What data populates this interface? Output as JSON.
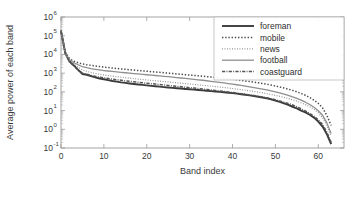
{
  "chart_data": {
    "type": "line",
    "title": "",
    "xlabel": "Band index",
    "ylabel": "Average power of each band",
    "xlim": [
      0,
      66
    ],
    "ylim": [
      0.1,
      1000000
    ],
    "yscale": "log",
    "xticks": [
      0,
      10,
      20,
      30,
      40,
      50,
      60
    ],
    "xticklabels": [
      "0",
      "10",
      "20",
      "30",
      "40",
      "50",
      "60"
    ],
    "yticks": [
      0.1,
      1,
      10,
      100,
      1000,
      10000,
      100000,
      1000000
    ],
    "yticklabels": [
      "10-1",
      "100",
      "101",
      "102",
      "103",
      "104",
      "105",
      "106"
    ],
    "ytick_bases": [
      "10",
      "10",
      "10",
      "10",
      "10",
      "10",
      "10",
      "10"
    ],
    "ytick_exponents": [
      "-1",
      "0",
      "1",
      "2",
      "3",
      "4",
      "5",
      "6"
    ],
    "grid": false,
    "legend_position": "top-right",
    "series": [
      {
        "name": "foreman",
        "style": "solid",
        "color": "#3b3b3b",
        "width": 1.9,
        "dash": "",
        "x": [
          0,
          1,
          2,
          3,
          4,
          5,
          6,
          7,
          8,
          9,
          10,
          11,
          12,
          13,
          14,
          15,
          16,
          17,
          18,
          19,
          20,
          21,
          22,
          23,
          24,
          25,
          26,
          27,
          28,
          29,
          30,
          31,
          32,
          33,
          34,
          35,
          36,
          37,
          38,
          39,
          40,
          41,
          42,
          43,
          44,
          45,
          46,
          47,
          48,
          49,
          50,
          51,
          52,
          53,
          54,
          55,
          56,
          57,
          58,
          59,
          60,
          61,
          62,
          63
        ],
        "y": [
          180000,
          12000,
          4200,
          2600,
          1500,
          900,
          820,
          700,
          600,
          520,
          470,
          420,
          380,
          350,
          320,
          300,
          280,
          262,
          248,
          235,
          222,
          210,
          200,
          190,
          180,
          172,
          164,
          156,
          150,
          143,
          137,
          131,
          126,
          120,
          115,
          110,
          105,
          100,
          95,
          90,
          85,
          80,
          75,
          70,
          65,
          60,
          55,
          50,
          45,
          40,
          34,
          29,
          24,
          20,
          16,
          13,
          10,
          8,
          6,
          4.2,
          2.6,
          1.4,
          0.55,
          0.16
        ]
      },
      {
        "name": "mobile",
        "style": "dotted",
        "color": "#4a4a4a",
        "width": 1.5,
        "dash": "1.4 1.8",
        "x": [
          0,
          1,
          2,
          3,
          4,
          5,
          6,
          7,
          8,
          9,
          10,
          11,
          12,
          13,
          14,
          15,
          16,
          17,
          18,
          19,
          20,
          21,
          22,
          23,
          24,
          25,
          26,
          27,
          28,
          29,
          30,
          31,
          32,
          33,
          34,
          35,
          36,
          37,
          38,
          39,
          40,
          41,
          42,
          43,
          44,
          45,
          46,
          47,
          48,
          49,
          50,
          51,
          52,
          53,
          54,
          55,
          56,
          57,
          58,
          59,
          60,
          61,
          62,
          63
        ],
        "y": [
          200000,
          13000,
          6000,
          4300,
          3600,
          3100,
          2800,
          2600,
          2400,
          2250,
          2100,
          1980,
          1870,
          1770,
          1680,
          1600,
          1520,
          1450,
          1380,
          1320,
          1260,
          1200,
          1150,
          1100,
          1050,
          1000,
          955,
          910,
          870,
          830,
          790,
          755,
          720,
          685,
          650,
          620,
          590,
          560,
          530,
          500,
          470,
          440,
          410,
          382,
          355,
          330,
          305,
          280,
          255,
          230,
          205,
          182,
          160,
          140,
          120,
          100,
          82,
          66,
          50,
          36,
          24,
          14,
          5.5,
          1.6
        ]
      },
      {
        "name": "news",
        "style": "fine-dotted",
        "color": "#8c8c8c",
        "width": 1.2,
        "dash": "0.9 1.6",
        "x": [
          0,
          1,
          2,
          3,
          4,
          5,
          6,
          7,
          8,
          9,
          10,
          11,
          12,
          13,
          14,
          15,
          16,
          17,
          18,
          19,
          20,
          21,
          22,
          23,
          24,
          25,
          26,
          27,
          28,
          29,
          30,
          31,
          32,
          33,
          34,
          35,
          36,
          37,
          38,
          39,
          40,
          41,
          42,
          43,
          44,
          45,
          46,
          47,
          48,
          49,
          50,
          51,
          52,
          53,
          54,
          55,
          56,
          57,
          58,
          59,
          60,
          61,
          62,
          63
        ],
        "y": [
          160000,
          10500,
          4500,
          3000,
          2100,
          1500,
          1250,
          1080,
          960,
          870,
          800,
          740,
          690,
          645,
          605,
          570,
          540,
          510,
          483,
          458,
          435,
          413,
          393,
          374,
          356,
          339,
          323,
          307,
          292,
          278,
          264,
          251,
          238,
          226,
          214,
          203,
          192,
          181,
          171,
          161,
          151,
          141,
          132,
          123,
          114,
          105,
          97,
          89,
          81,
          73,
          65,
          58,
          51,
          44,
          38,
          32,
          26,
          21,
          16,
          11.5,
          7.5,
          4.2,
          1.6,
          0.42
        ]
      },
      {
        "name": "football",
        "style": "solid",
        "color": "#8f8f8f",
        "width": 1.3,
        "dash": "",
        "x": [
          0,
          1,
          2,
          3,
          4,
          5,
          6,
          7,
          8,
          9,
          10,
          11,
          12,
          13,
          14,
          15,
          16,
          17,
          18,
          19,
          20,
          21,
          22,
          23,
          24,
          25,
          26,
          27,
          28,
          29,
          30,
          31,
          32,
          33,
          34,
          35,
          36,
          37,
          38,
          39,
          40,
          41,
          42,
          43,
          44,
          45,
          46,
          47,
          48,
          49,
          50,
          51,
          52,
          53,
          54,
          55,
          56,
          57,
          58,
          59,
          60,
          61,
          62,
          63
        ],
        "y": [
          190000,
          11500,
          5200,
          3600,
          2800,
          2200,
          1950,
          1750,
          1600,
          1480,
          1380,
          1300,
          1230,
          1165,
          1105,
          1050,
          1000,
          952,
          907,
          864,
          823,
          784,
          747,
          711,
          677,
          644,
          612,
          581,
          551,
          522,
          494,
          467,
          441,
          416,
          391,
          367,
          344,
          322,
          300,
          279,
          259,
          240,
          221,
          203,
          186,
          170,
          155,
          140,
          126,
          112,
          99,
          87,
          75,
          64,
          54,
          45,
          36,
          28,
          21,
          15,
          9.8,
          5.6,
          2.2,
          0.6
        ]
      },
      {
        "name": "coastguard",
        "style": "dash-dot",
        "color": "#555555",
        "width": 1.5,
        "dash": "3.2 1.3 0.9 1.3",
        "x": [
          0,
          1,
          2,
          3,
          4,
          5,
          6,
          7,
          8,
          9,
          10,
          11,
          12,
          13,
          14,
          15,
          16,
          17,
          18,
          19,
          20,
          21,
          22,
          23,
          24,
          25,
          26,
          27,
          28,
          29,
          30,
          31,
          32,
          33,
          34,
          35,
          36,
          37,
          38,
          39,
          40,
          41,
          42,
          43,
          44,
          45,
          46,
          47,
          48,
          49,
          50,
          51,
          52,
          53,
          54,
          55,
          56,
          57,
          58,
          59,
          60,
          61,
          62,
          63
        ],
        "y": [
          170000,
          11000,
          4000,
          2400,
          1450,
          1000,
          870,
          760,
          680,
          615,
          560,
          515,
          478,
          445,
          416,
          390,
          367,
          345,
          325,
          307,
          290,
          275,
          260,
          246,
          233,
          221,
          209,
          198,
          188,
          178,
          168,
          159,
          150,
          142,
          134,
          126,
          119,
          112,
          105,
          98,
          92,
          86,
          80,
          74,
          68,
          63,
          58,
          53,
          48,
          43,
          38,
          33,
          28,
          24,
          20,
          16,
          12.5,
          9.5,
          7,
          5,
          3.2,
          1.8,
          0.7,
          0.2
        ]
      }
    ],
    "legend_entries": [
      {
        "label": "foreman"
      },
      {
        "label": "mobile"
      },
      {
        "label": "news"
      },
      {
        "label": "football"
      },
      {
        "label": "coastguard"
      }
    ]
  }
}
